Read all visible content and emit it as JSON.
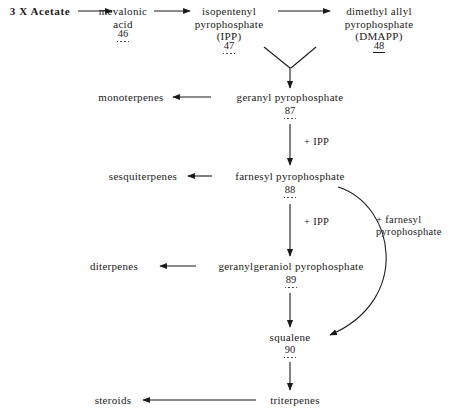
{
  "diagram": {
    "background_color": "#ffffff",
    "stroke_color": "#1a1a1a"
  },
  "nodes": {
    "acetate": "3 X Acetate",
    "mevalonic_acid": "mevalonic\nacid",
    "ipp": "isopentenyl\npyrophosphate\n(IPP)",
    "dmapp": "dimethyl allyl\npyrophosphate\n(DMAPP)",
    "monoterpenes": "monoterpenes",
    "geranyl_pp": "geranyl pyrophosphate",
    "sesquiterpenes": "sesquiterpenes",
    "farnesyl_pp": "farnesyl pyrophosphate",
    "diterpenes": "diterpenes",
    "geranylgeraniol_pp": "geranylgeraniol pyrophosphate",
    "squalene": "squalene",
    "triterpenes": "triterpenes",
    "steroids": "steroids"
  },
  "compound_numbers": {
    "mevalonic_acid": "46",
    "ipp": "47",
    "dmapp": "48",
    "geranyl_pp": "87",
    "farnesyl_pp": "88",
    "geranylgeraniol_pp": "89",
    "squalene": "90"
  },
  "annotations": {
    "ipp_addition_1": "+ IPP",
    "ipp_addition_2": "+ IPP",
    "farnesyl_addition": "+ farnesyl\npyrophosphate"
  }
}
